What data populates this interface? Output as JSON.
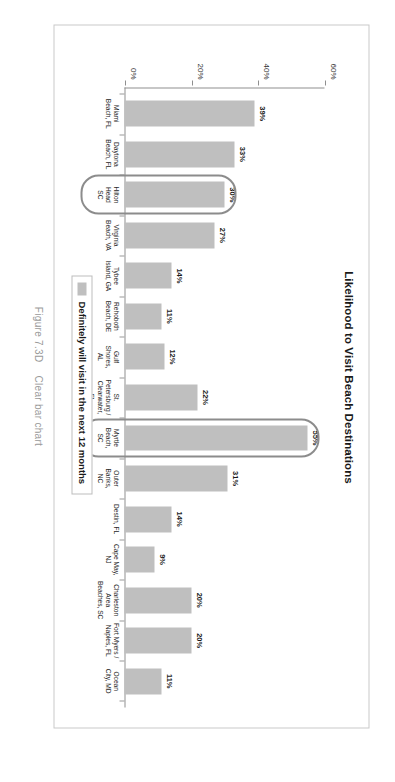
{
  "figure": {
    "number": "Figure 7.3D",
    "caption": "Clear bar chart"
  },
  "legend": {
    "label": "Definitely will visit in the next 12 months",
    "swatch_color": "#bfbfbf"
  },
  "colors": {
    "bar": "#bfbfbf",
    "callout_border": "#8c8c8c",
    "axis": "#8f8f8f",
    "frame": "#c9c9c9",
    "caption_text": "#9a9a9a"
  },
  "chart_data": {
    "type": "bar",
    "title": "Likelihood to Visit Beach Destinations",
    "xlabel": "",
    "ylabel": "",
    "ylim": [
      0,
      60
    ],
    "grid": false,
    "legend_position": "bottom",
    "ytick_labels": [
      "0%",
      "20%",
      "40%",
      "60%"
    ],
    "ytick_values": [
      0,
      20,
      40,
      60
    ],
    "series_name": "Definitely will visit in the next 12 months",
    "categories": [
      "Miami Beach, FL",
      "Daytona Beach, FL",
      "Hilton Head SC",
      "Virginia Beach, VA",
      "Tybee Island, GA",
      "Rehoboth Beach, DE",
      "Gulf Shores, AL",
      "St. Petersburg / Clearwater, FL",
      "Myrtle Beach, SC",
      "Outer Banks, NC",
      "Destin, FL",
      "Cape May, NJ",
      "Charleston Area Beaches, SC",
      "Fort Myers / Naples, FL",
      "Ocean City, MD"
    ],
    "category_lines": [
      [
        "Miami",
        "Beach, FL"
      ],
      [
        "Daytona",
        "Beach, FL"
      ],
      [
        "Hilton",
        "Head",
        "SC"
      ],
      [
        "Virginia",
        "Beach, VA"
      ],
      [
        "Tybee",
        "Island, GA"
      ],
      [
        "Rehoboth",
        "Beach, DE"
      ],
      [
        "Gulf",
        "Shores,",
        "AL"
      ],
      [
        "St.",
        "Petersburg /",
        "Clearwater,",
        "FL"
      ],
      [
        "Myrtle",
        "Beach,",
        "SC"
      ],
      [
        "Outer",
        "Banks,",
        "NC"
      ],
      [
        "Destin, FL"
      ],
      [
        "Cape May,",
        "NJ"
      ],
      [
        "Charleston",
        "Area",
        "Beaches, SC"
      ],
      [
        "Fort Myers /",
        "Naples, FL"
      ],
      [
        "Ocean",
        "City, MD"
      ]
    ],
    "values": [
      39,
      33,
      30,
      27,
      14,
      11,
      12,
      22,
      55,
      31,
      14,
      9,
      20,
      20,
      11
    ],
    "value_labels": [
      "39%",
      "33%",
      "30%",
      "27%",
      "14%",
      "11%",
      "12%",
      "22%",
      "55%",
      "31%",
      "14%",
      "9%",
      "20%",
      "20%",
      "11%"
    ],
    "highlighted_categories": [
      "Hilton Head SC",
      "Myrtle Beach, SC"
    ],
    "highlighted_indices": [
      2,
      8
    ]
  }
}
